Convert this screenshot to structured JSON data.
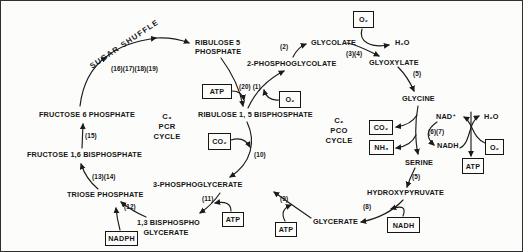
{
  "nodes": {
    "sugar_shuffle": "SUGAR SHUFFLE",
    "ribulose_5_phosphate_line1": "RIBULOSE 5",
    "ribulose_5_phosphate_line2": "PHOSPHATE",
    "ribulose_15_bisphosphate": "RIBULOSE 1, 5 BISPHOSPHATE",
    "phosphoglycolate_2": "2-PHOSPHOGLYCOLATE",
    "glycolate": "GLYCOLATE",
    "glyoxylate": "GLYOXYLATE",
    "glycine": "GLYCINE",
    "serine": "SERINE",
    "hydroxypyruvate": "HYDROXYPYRUVATE",
    "glycerate": "GLYCERATE",
    "phosphoglycerate_3": "3-PHOSPHOGLYCERATE",
    "bisphosphoglycerate_line1": "1,3 BISPHOSPHO",
    "bisphosphoglycerate_line2": "GLYCERATE",
    "triose_phosphate": "TRIOSE PHOSPHATE",
    "fructose_16_bisphosphate": "FRUCTOSE 1,6 BISPHOSPHATE",
    "fructose_6_phosphate": "FRUCTOSE 6 PHOSPHATE",
    "nad_plus": "NAD⁺",
    "nadh": "NADH",
    "h2o": "H₂O"
  },
  "cycles": {
    "c3": {
      "symbol": "C₃",
      "name": "PCR",
      "word": "CYCLE"
    },
    "c2": {
      "symbol": "C₂",
      "name": "PCO",
      "word": "CYCLE"
    }
  },
  "steps": {
    "s2": "(2)",
    "s3_4": "(3)(4)",
    "s5": "(5)",
    "s6_7": "(6)(7)",
    "s8": "(8)",
    "s9": "(9)",
    "s10": "(10)",
    "s11": "(11)",
    "s12": "(12)",
    "s13_14": "(13)(14)",
    "s15": "(15)",
    "s16_19": "(16)(17)(18)(19)",
    "s20_1": "(20) (1)"
  },
  "boxes": {
    "atp": "ATP",
    "o2": "O₂",
    "co2": "CO₂",
    "nh3": "NH₃",
    "nadh": "NADH",
    "nadph": "NADPH"
  },
  "colors": {
    "ink": "#1b1b1b",
    "background": "#fcfcfa"
  }
}
